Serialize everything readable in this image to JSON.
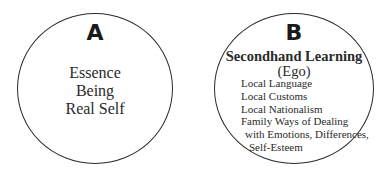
{
  "circle_a": {
    "label": "A",
    "lines": [
      "Essence",
      "Being",
      "Real Self"
    ]
  },
  "circle_b": {
    "label": "B",
    "title": "Secondhand Learning",
    "subtitle": "(Ego)",
    "items": [
      "Local Language",
      "Local Customs",
      "Local Nationalism",
      "Family Ways of Dealing",
      "with Emotions, Differences,",
      "Self-Esteem"
    ]
  }
}
